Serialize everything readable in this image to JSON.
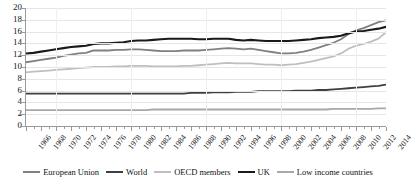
{
  "chart_data": {
    "type": "line",
    "title": "",
    "xlabel": "",
    "ylabel": "",
    "ylim": [
      0,
      20
    ],
    "ytick_step": 2,
    "yticks": [
      "0",
      "2",
      "4",
      "6",
      "8",
      "10",
      "12",
      "14",
      "16",
      "18",
      "20"
    ],
    "grid": true,
    "legend_position": "bottom",
    "x": [
      1966,
      1967,
      1968,
      1969,
      1970,
      1971,
      1972,
      1973,
      1974,
      1975,
      1976,
      1977,
      1978,
      1979,
      1980,
      1981,
      1982,
      1983,
      1984,
      1985,
      1986,
      1987,
      1988,
      1989,
      1990,
      1991,
      1992,
      1993,
      1994,
      1995,
      1996,
      1997,
      1998,
      1999,
      2000,
      2001,
      2002,
      2003,
      2004,
      2005,
      2006,
      2007,
      2008,
      2009,
      2010,
      2011,
      2012,
      2013,
      2014
    ],
    "xticks": [
      "1966",
      "1968",
      "1970",
      "1972",
      "1974",
      "1976",
      "1978",
      "1980",
      "1982",
      "1984",
      "1986",
      "1988",
      "1990",
      "1992",
      "1994",
      "1996",
      "1998",
      "2000",
      "2002",
      "2004",
      "2006",
      "2008",
      "2010",
      "2012",
      "2014"
    ],
    "series": [
      {
        "name": "European Union",
        "color": "#808080",
        "width": 1.8,
        "values": [
          10.8,
          11.0,
          11.2,
          11.4,
          11.6,
          11.9,
          12.1,
          12.3,
          12.4,
          12.8,
          12.8,
          12.8,
          12.9,
          12.9,
          13.0,
          13.0,
          12.9,
          12.8,
          12.7,
          12.7,
          12.7,
          12.8,
          12.8,
          12.8,
          12.9,
          13.0,
          13.1,
          13.2,
          13.1,
          13.0,
          13.1,
          12.9,
          12.7,
          12.5,
          12.3,
          12.3,
          12.4,
          12.6,
          12.9,
          13.3,
          13.7,
          14.1,
          14.7,
          15.6,
          16.2,
          16.6,
          17.1,
          17.6,
          17.9
        ]
      },
      {
        "name": "World",
        "color": "#3f3f3f",
        "width": 1.8,
        "values": [
          5.5,
          5.5,
          5.5,
          5.5,
          5.5,
          5.5,
          5.5,
          5.5,
          5.5,
          5.5,
          5.5,
          5.5,
          5.5,
          5.5,
          5.5,
          5.5,
          5.5,
          5.5,
          5.5,
          5.5,
          5.5,
          5.5,
          5.6,
          5.6,
          5.6,
          5.7,
          5.7,
          5.7,
          5.8,
          5.8,
          5.8,
          5.9,
          5.9,
          5.9,
          5.9,
          5.9,
          6.0,
          6.0,
          6.0,
          6.1,
          6.1,
          6.2,
          6.3,
          6.4,
          6.5,
          6.6,
          6.7,
          6.8,
          7.0
        ]
      },
      {
        "name": "OECD members",
        "color": "#bfbfbf",
        "width": 1.8,
        "values": [
          9.1,
          9.2,
          9.3,
          9.4,
          9.5,
          9.6,
          9.7,
          9.8,
          9.9,
          10.0,
          10.0,
          10.0,
          10.1,
          10.1,
          10.2,
          10.2,
          10.2,
          10.1,
          10.1,
          10.1,
          10.1,
          10.2,
          10.2,
          10.3,
          10.4,
          10.5,
          10.6,
          10.7,
          10.6,
          10.6,
          10.6,
          10.5,
          10.4,
          10.4,
          10.3,
          10.4,
          10.5,
          10.7,
          10.9,
          11.2,
          11.5,
          11.8,
          12.3,
          13.1,
          13.6,
          13.9,
          14.3,
          14.8,
          15.9
        ]
      },
      {
        "name": "UK",
        "color": "#1a1a1a",
        "width": 2.1,
        "values": [
          12.3,
          12.4,
          12.6,
          12.8,
          13.0,
          13.2,
          13.4,
          13.5,
          13.6,
          13.9,
          14.0,
          14.0,
          14.1,
          14.2,
          14.4,
          14.5,
          14.5,
          14.6,
          14.7,
          14.8,
          14.8,
          14.8,
          14.8,
          14.7,
          14.7,
          14.8,
          14.8,
          14.8,
          14.6,
          14.5,
          14.6,
          14.5,
          14.4,
          14.4,
          14.4,
          14.4,
          14.5,
          14.6,
          14.7,
          14.9,
          15.0,
          15.1,
          15.3,
          15.7,
          16.0,
          16.1,
          16.3,
          16.5,
          16.8
        ]
      },
      {
        "name": "Low income countries",
        "color": "#a8a8a8",
        "width": 1.8,
        "values": [
          2.7,
          2.7,
          2.7,
          2.7,
          2.7,
          2.7,
          2.7,
          2.7,
          2.7,
          2.7,
          2.7,
          2.7,
          2.7,
          2.7,
          2.7,
          2.7,
          2.7,
          2.8,
          2.8,
          2.8,
          2.8,
          2.8,
          2.8,
          2.8,
          2.8,
          2.8,
          2.8,
          2.8,
          2.8,
          2.8,
          2.8,
          2.8,
          2.8,
          2.8,
          2.8,
          2.8,
          2.8,
          2.8,
          2.8,
          2.8,
          2.8,
          2.9,
          2.9,
          2.9,
          2.9,
          2.9,
          2.9,
          3.0,
          3.0
        ]
      }
    ]
  }
}
